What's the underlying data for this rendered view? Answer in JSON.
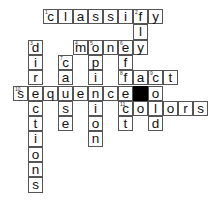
{
  "puzzle": {
    "type": "crossword",
    "grid": {
      "origin_x": 13,
      "origin_y": 9,
      "cell_w": 15,
      "cell_h": 15.3
    },
    "colors": {
      "cell_bg": "#ffffff",
      "cell_border": "#555555",
      "block": "#000000",
      "text": "#111111"
    },
    "words": [
      {
        "number": "1",
        "direction": "across",
        "answer": "classify",
        "row": 0,
        "col": 2
      },
      {
        "number": "2",
        "direction": "down",
        "answer": "fly",
        "row": 0,
        "col": 8
      },
      {
        "number": "3",
        "direction": "down",
        "answer": "directions",
        "row": 2,
        "col": 1
      },
      {
        "number": "4",
        "direction": "across",
        "answer": "money",
        "row": 2,
        "col": 4
      },
      {
        "number": "5",
        "direction": "down",
        "answer": "opinion",
        "row": 2,
        "col": 5
      },
      {
        "number": "6",
        "direction": "down",
        "answer": "effect",
        "row": 2,
        "col": 7
      },
      {
        "number": "7",
        "direction": "down",
        "answer": "cause",
        "row": 3,
        "col": 3
      },
      {
        "number": "8",
        "direction": "across",
        "answer": "fact",
        "row": 4,
        "col": 7
      },
      {
        "number": "9",
        "direction": "down",
        "answer": "cold",
        "row": 4,
        "col": 9
      },
      {
        "number": "10",
        "direction": "across",
        "answer": "sequence",
        "row": 5,
        "col": 0
      },
      {
        "number": "11",
        "direction": "across",
        "answer": "colors",
        "row": 6,
        "col": 7
      }
    ],
    "cells": [
      {
        "row": 0,
        "col": 2,
        "letter": "c",
        "num": "1"
      },
      {
        "row": 0,
        "col": 3,
        "letter": "l",
        "num": ""
      },
      {
        "row": 0,
        "col": 4,
        "letter": "a",
        "num": ""
      },
      {
        "row": 0,
        "col": 5,
        "letter": "s",
        "num": ""
      },
      {
        "row": 0,
        "col": 6,
        "letter": "s",
        "num": ""
      },
      {
        "row": 0,
        "col": 7,
        "letter": "i",
        "num": ""
      },
      {
        "row": 0,
        "col": 8,
        "letter": "f",
        "num": "2"
      },
      {
        "row": 0,
        "col": 9,
        "letter": "y",
        "num": ""
      },
      {
        "row": 1,
        "col": 8,
        "letter": "l",
        "num": ""
      },
      {
        "row": 2,
        "col": 1,
        "letter": "d",
        "num": "3"
      },
      {
        "row": 2,
        "col": 4,
        "letter": "m",
        "num": "4"
      },
      {
        "row": 2,
        "col": 5,
        "letter": "o",
        "num": "5"
      },
      {
        "row": 2,
        "col": 6,
        "letter": "n",
        "num": ""
      },
      {
        "row": 2,
        "col": 7,
        "letter": "e",
        "num": "6"
      },
      {
        "row": 2,
        "col": 8,
        "letter": "y",
        "num": ""
      },
      {
        "row": 3,
        "col": 1,
        "letter": "i",
        "num": ""
      },
      {
        "row": 3,
        "col": 3,
        "letter": "c",
        "num": "7"
      },
      {
        "row": 3,
        "col": 5,
        "letter": "p",
        "num": ""
      },
      {
        "row": 3,
        "col": 7,
        "letter": "f",
        "num": ""
      },
      {
        "row": 4,
        "col": 1,
        "letter": "r",
        "num": ""
      },
      {
        "row": 4,
        "col": 3,
        "letter": "a",
        "num": ""
      },
      {
        "row": 4,
        "col": 5,
        "letter": "i",
        "num": ""
      },
      {
        "row": 4,
        "col": 7,
        "letter": "f",
        "num": "8"
      },
      {
        "row": 4,
        "col": 8,
        "letter": "a",
        "num": ""
      },
      {
        "row": 4,
        "col": 9,
        "letter": "c",
        "num": "9"
      },
      {
        "row": 4,
        "col": 10,
        "letter": "t",
        "num": ""
      },
      {
        "row": 5,
        "col": 0,
        "letter": "s",
        "num": "10"
      },
      {
        "row": 5,
        "col": 1,
        "letter": "e",
        "num": ""
      },
      {
        "row": 5,
        "col": 2,
        "letter": "q",
        "num": ""
      },
      {
        "row": 5,
        "col": 3,
        "letter": "u",
        "num": ""
      },
      {
        "row": 5,
        "col": 4,
        "letter": "e",
        "num": ""
      },
      {
        "row": 5,
        "col": 5,
        "letter": "n",
        "num": ""
      },
      {
        "row": 5,
        "col": 6,
        "letter": "c",
        "num": ""
      },
      {
        "row": 5,
        "col": 7,
        "letter": "e",
        "num": ""
      },
      {
        "row": 5,
        "col": 8,
        "letter": "",
        "num": "",
        "block": true
      },
      {
        "row": 5,
        "col": 9,
        "letter": "o",
        "num": ""
      },
      {
        "row": 6,
        "col": 1,
        "letter": "c",
        "num": ""
      },
      {
        "row": 6,
        "col": 3,
        "letter": "s",
        "num": ""
      },
      {
        "row": 6,
        "col": 5,
        "letter": "i",
        "num": ""
      },
      {
        "row": 6,
        "col": 7,
        "letter": "c",
        "num": "11"
      },
      {
        "row": 6,
        "col": 8,
        "letter": "o",
        "num": ""
      },
      {
        "row": 6,
        "col": 9,
        "letter": "l",
        "num": ""
      },
      {
        "row": 6,
        "col": 10,
        "letter": "o",
        "num": ""
      },
      {
        "row": 6,
        "col": 11,
        "letter": "r",
        "num": ""
      },
      {
        "row": 6,
        "col": 12,
        "letter": "s",
        "num": ""
      },
      {
        "row": 7,
        "col": 1,
        "letter": "t",
        "num": ""
      },
      {
        "row": 7,
        "col": 3,
        "letter": "e",
        "num": ""
      },
      {
        "row": 7,
        "col": 5,
        "letter": "o",
        "num": ""
      },
      {
        "row": 7,
        "col": 7,
        "letter": "t",
        "num": ""
      },
      {
        "row": 7,
        "col": 9,
        "letter": "d",
        "num": ""
      },
      {
        "row": 8,
        "col": 1,
        "letter": "i",
        "num": ""
      },
      {
        "row": 8,
        "col": 5,
        "letter": "n",
        "num": ""
      },
      {
        "row": 9,
        "col": 1,
        "letter": "o",
        "num": ""
      },
      {
        "row": 10,
        "col": 1,
        "letter": "n",
        "num": ""
      },
      {
        "row": 11,
        "col": 1,
        "letter": "s",
        "num": ""
      }
    ]
  }
}
